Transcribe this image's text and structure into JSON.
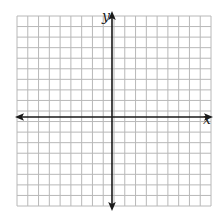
{
  "diagram": {
    "type": "coordinate-plane",
    "x_axis_label": "x",
    "y_axis_label": "y",
    "grid_columns": 18,
    "grid_rows": 18,
    "x_range": [
      -9,
      9
    ],
    "y_range": [
      -9,
      9
    ],
    "arrows": {
      "x_axis": "both-ends",
      "y_axis": "both-ends"
    },
    "colors": {
      "grid": "#b8b8b8",
      "axis": "#1a1a1a",
      "background": "#ffffff"
    }
  }
}
